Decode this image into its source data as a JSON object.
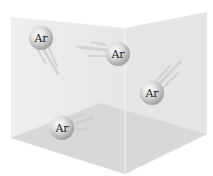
{
  "diagram": {
    "atoms": [
      {
        "label": "Ar",
        "cx": 41,
        "cy": 38
      },
      {
        "label": "Ar",
        "cx": 118,
        "cy": 54
      },
      {
        "label": "Ar",
        "cx": 152,
        "cy": 93
      },
      {
        "label": "Ar",
        "cx": 62,
        "cy": 128
      }
    ],
    "colors": {
      "wall_left": "#ececec",
      "wall_right": "#e4e4e4",
      "floor": "#d9d9d9",
      "atom": "#c8c8c8",
      "trail": "#cfcfcf"
    }
  }
}
